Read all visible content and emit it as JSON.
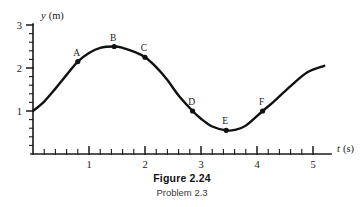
{
  "figure": {
    "caption_label": "Figure",
    "caption_number": "2.24",
    "caption_sub": "Problem 2.3",
    "top_partial": ""
  },
  "chart_data": {
    "type": "line",
    "subtitle": "Problem 2.3",
    "xlabel_var": "t",
    "xlabel_unit": "(s)",
    "ylabel_var": "y",
    "ylabel_unit": "(m)",
    "xlim": [
      0,
      5.2
    ],
    "ylim": [
      0,
      3
    ],
    "x_major_ticks": [
      1,
      2,
      3,
      4,
      5
    ],
    "x_major_tick_labels": [
      "1",
      "2",
      "3",
      "4",
      "5"
    ],
    "x_minor_tick_step": 0.2,
    "y_major_ticks": [
      1,
      2,
      3
    ],
    "y_major_tick_labels": [
      "1",
      "2",
      "3"
    ],
    "y_minor_tick_step": 0.2,
    "grid": false,
    "legend": false,
    "series": [
      {
        "name": "y(t)",
        "x": [
          0.0,
          0.2,
          0.4,
          0.6,
          0.8,
          1.0,
          1.2,
          1.45,
          1.6,
          1.8,
          2.0,
          2.2,
          2.4,
          2.6,
          2.85,
          3.0,
          3.2,
          3.45,
          3.6,
          3.8,
          4.1,
          4.3,
          4.6,
          4.9,
          5.2
        ],
        "y": [
          1.0,
          1.22,
          1.52,
          1.84,
          2.15,
          2.35,
          2.47,
          2.5,
          2.47,
          2.38,
          2.25,
          2.02,
          1.72,
          1.36,
          1.0,
          0.82,
          0.64,
          0.55,
          0.56,
          0.66,
          1.0,
          1.22,
          1.58,
          1.9,
          2.05
        ]
      }
    ],
    "points": [
      {
        "label": "A",
        "t": 0.8,
        "y": 2.15
      },
      {
        "label": "B",
        "t": 1.45,
        "y": 2.5
      },
      {
        "label": "C",
        "t": 2.0,
        "y": 2.25
      },
      {
        "label": "D",
        "t": 2.85,
        "y": 1.0
      },
      {
        "label": "E",
        "t": 3.45,
        "y": 0.55
      },
      {
        "label": "F",
        "t": 4.1,
        "y": 1.0
      }
    ],
    "colors": {
      "curve": "#111111",
      "axis": "#1a1a1a",
      "marker": "#111111",
      "background": "#ffffff"
    }
  }
}
